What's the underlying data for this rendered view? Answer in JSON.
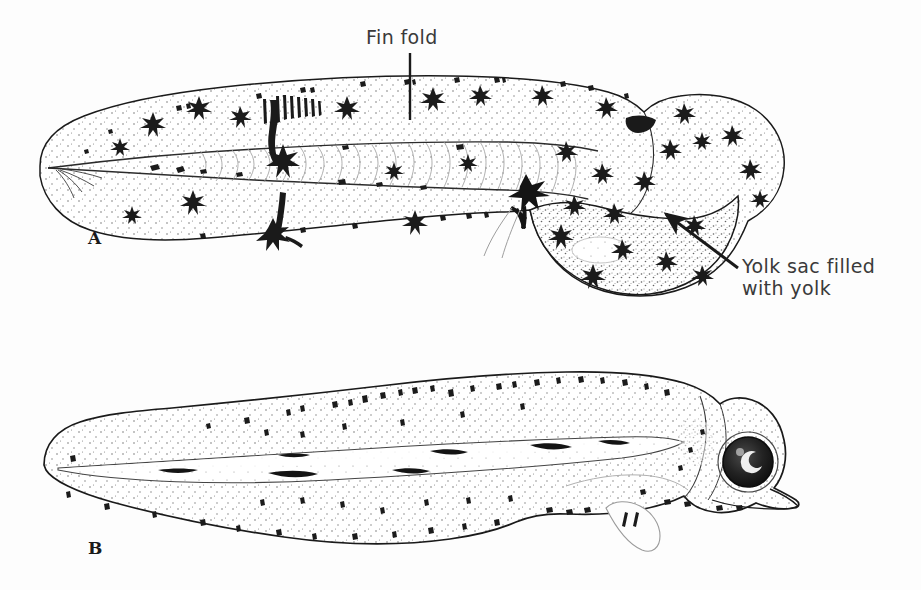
{
  "figure": {
    "background_color": "#fdfdfd",
    "ink_color": "#1a1a1a",
    "label_color": "#3a3a3a",
    "width": 921,
    "height": 590
  },
  "labels": {
    "fin_fold": "Fin fold",
    "yolk_sac": "Yolk sac filled\nwith yolk"
  },
  "panels": [
    {
      "letter": "A",
      "caption": "Yolk-sac larva with continuous median fin fold and large yolk sac",
      "features": [
        "fin fold",
        "notochord",
        "myomeres",
        "melanophores",
        "yolk sac filled with yolk",
        "head"
      ]
    },
    {
      "letter": "B",
      "caption": "Older larva after yolk absorption with pigmented eye and pectoral fin",
      "features": [
        "notochord",
        "melanophores",
        "pigmented eye",
        "mouth",
        "pectoral fin",
        "gut"
      ]
    }
  ]
}
